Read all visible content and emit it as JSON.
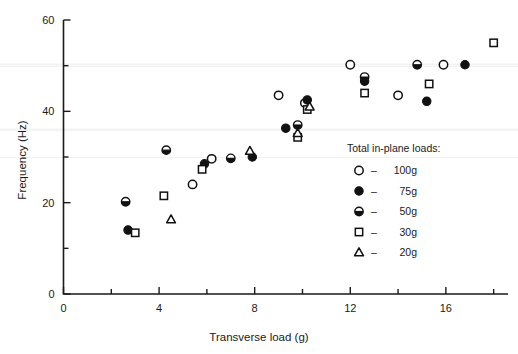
{
  "chart_data": {
    "type": "scatter",
    "title": "",
    "xlabel": "Transverse load (g)",
    "ylabel": "Frequency (Hz)",
    "xlim": [
      0,
      18.6
    ],
    "ylim": [
      0,
      60
    ],
    "xticks": [
      0,
      4,
      8,
      12,
      16
    ],
    "xticklabels": [
      "0",
      "4",
      "8",
      "12",
      "16"
    ],
    "xminorticks": [
      2,
      6,
      10,
      14,
      18
    ],
    "yticks": [
      0,
      20,
      40,
      60
    ],
    "yticklabels": [
      "0",
      "20",
      "40",
      "60"
    ],
    "yminorticks": [
      10,
      30,
      50
    ],
    "grid": false,
    "legend_position": "right-middle",
    "legend_title": "Total in-plane loads:",
    "series": [
      {
        "name": "100g",
        "marker": "open-circle",
        "points": [
          {
            "x": 5.4,
            "y": 24.0
          },
          {
            "x": 6.2,
            "y": 29.6
          },
          {
            "x": 9.0,
            "y": 43.5
          },
          {
            "x": 10.1,
            "y": 41.8
          },
          {
            "x": 12.0,
            "y": 50.2
          },
          {
            "x": 14.0,
            "y": 43.5
          },
          {
            "x": 15.9,
            "y": 50.2
          }
        ]
      },
      {
        "name": "75g",
        "marker": "filled-circle",
        "points": [
          {
            "x": 2.7,
            "y": 14.0
          },
          {
            "x": 5.9,
            "y": 28.5
          },
          {
            "x": 7.9,
            "y": 30.0
          },
          {
            "x": 9.3,
            "y": 36.3
          },
          {
            "x": 10.2,
            "y": 42.5
          },
          {
            "x": 12.6,
            "y": 46.6
          },
          {
            "x": 15.2,
            "y": 42.2
          },
          {
            "x": 16.8,
            "y": 50.2
          }
        ]
      },
      {
        "name": "50g",
        "marker": "half-circle",
        "points": [
          {
            "x": 2.6,
            "y": 20.2
          },
          {
            "x": 4.3,
            "y": 31.5
          },
          {
            "x": 7.0,
            "y": 29.7
          },
          {
            "x": 9.8,
            "y": 37.0
          },
          {
            "x": 12.6,
            "y": 47.5
          },
          {
            "x": 14.8,
            "y": 50.2
          }
        ]
      },
      {
        "name": "30g",
        "marker": "open-square",
        "points": [
          {
            "x": 3.0,
            "y": 13.4
          },
          {
            "x": 4.2,
            "y": 21.5
          },
          {
            "x": 5.8,
            "y": 27.3
          },
          {
            "x": 9.8,
            "y": 34.3
          },
          {
            "x": 10.2,
            "y": 40.4
          },
          {
            "x": 12.6,
            "y": 44.0
          },
          {
            "x": 15.3,
            "y": 46.0
          },
          {
            "x": 18.0,
            "y": 55.0
          }
        ]
      },
      {
        "name": "20g",
        "marker": "open-triangle",
        "points": [
          {
            "x": 4.5,
            "y": 16.3
          },
          {
            "x": 7.8,
            "y": 31.3
          },
          {
            "x": 9.8,
            "y": 35.2
          },
          {
            "x": 10.3,
            "y": 41.0
          }
        ]
      }
    ]
  },
  "legend": {
    "title": "Total in-plane loads:",
    "entries": [
      {
        "label": "100g",
        "marker": "open-circle",
        "dash": "–"
      },
      {
        "label": "75g",
        "marker": "filled-circle",
        "dash": "–"
      },
      {
        "label": "50g",
        "marker": "half-circle",
        "dash": "–"
      },
      {
        "label": "30g",
        "marker": "open-square",
        "dash": "–"
      },
      {
        "label": "20g",
        "marker": "open-triangle",
        "dash": "–"
      }
    ]
  },
  "colors": {
    "marker": "#111111",
    "axis": "#1a1a1a",
    "background": "#ffffff"
  }
}
